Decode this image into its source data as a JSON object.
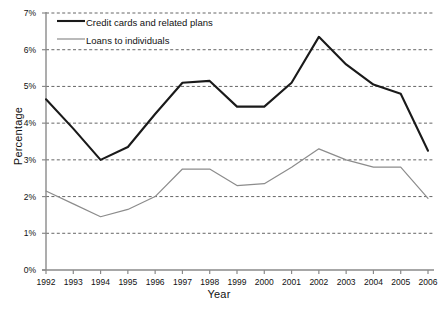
{
  "chart_data": {
    "type": "line",
    "title": "",
    "xlabel": "Year",
    "ylabel": "Percentage",
    "x": [
      1992,
      1993,
      1994,
      1995,
      1996,
      1997,
      1998,
      1999,
      2000,
      2001,
      2002,
      2003,
      2004,
      2005,
      2006
    ],
    "xtick_labels": [
      "1992",
      "1993",
      "1994",
      "1995",
      "1996",
      "1997",
      "1998",
      "1999",
      "2000",
      "2001",
      "2002",
      "2003",
      "2004",
      "2005",
      "2006"
    ],
    "ytick_labels": [
      "0%",
      "1%",
      "2%",
      "3%",
      "4%",
      "5%",
      "6%",
      "7%"
    ],
    "ytick_values": [
      0,
      1,
      2,
      3,
      4,
      5,
      6,
      7
    ],
    "ylim": [
      0,
      7
    ],
    "xlim": [
      1992,
      2006
    ],
    "grid": true,
    "grid_axis": "y",
    "legend_position": "top-left-inside",
    "series": [
      {
        "name": "Credit cards and related plans",
        "color": "#1a1a1a",
        "line_width": 2.1,
        "values": [
          4.65,
          3.85,
          3.0,
          3.35,
          4.25,
          5.1,
          5.15,
          4.45,
          4.45,
          5.1,
          6.35,
          5.6,
          5.05,
          4.8,
          3.25
        ]
      },
      {
        "name": "Loans to individuals",
        "color": "#8c8c8c",
        "line_width": 1.2,
        "values": [
          2.15,
          1.8,
          1.45,
          1.65,
          2.0,
          2.75,
          2.75,
          2.3,
          2.35,
          2.8,
          3.3,
          3.0,
          2.8,
          2.8,
          1.95
        ]
      }
    ]
  },
  "legend": {
    "items": [
      {
        "label": "Credit cards and related plans"
      },
      {
        "label": "Loans to individuals"
      }
    ]
  },
  "colors": {
    "series_1": "#1a1a1a",
    "series_2": "#8c8c8c",
    "axis": "#888888",
    "grid": "#555555",
    "text": "#111111"
  }
}
